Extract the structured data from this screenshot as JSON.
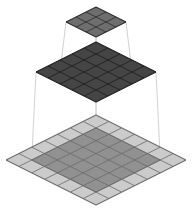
{
  "figure": {
    "type": "isometric-layer-stack-diagram",
    "background_color": "#ffffff",
    "canvas": {
      "width": 192,
      "height": 209
    }
  },
  "chart_data": {
    "type": "diagram",
    "title": "",
    "layers": [
      {
        "name": "top-layer",
        "label": "top feature map",
        "rows": 3,
        "cols": 3,
        "cells": 9,
        "fill_color": "#6e6e6e",
        "grid_line_color": "#2b2b2b",
        "center": {
          "x": 96,
          "y": 22
        },
        "half_width": 30,
        "half_height": 15,
        "shaded_region": null
      },
      {
        "name": "middle-layer",
        "label": "middle feature map",
        "rows": 5,
        "cols": 5,
        "cells": 25,
        "fill_color": "#454545",
        "grid_line_color": "#1c1c1c",
        "center": {
          "x": 96,
          "y": 72
        },
        "half_width": 60,
        "half_height": 30,
        "shaded_region": null
      },
      {
        "name": "bottom-layer",
        "label": "input plane",
        "rows": 7,
        "cols": 7,
        "cells": 49,
        "fill_color": "#cbcbcb",
        "grid_line_color": "#6a6a6a",
        "center": {
          "x": 96,
          "y": 160
        },
        "half_width": 90,
        "half_height": 45,
        "shaded_region": {
          "name": "receptive-field",
          "rows": 5,
          "cols": 5,
          "row_start": 1,
          "col_start": 1,
          "fill_color": "#919191"
        }
      }
    ],
    "connectors": {
      "name": "projection-lines",
      "color": "#d2d2d2",
      "width": 1,
      "groups": [
        {
          "from_layer": "top-layer",
          "to_layer": "middle-layer",
          "count": 4
        },
        {
          "from_layer": "middle-layer",
          "to_layer": "bottom-layer",
          "count": 4
        }
      ]
    },
    "palette": {
      "top": "#6e6e6e",
      "middle": "#454545",
      "bottom_outer": "#cbcbcb",
      "bottom_inner": "#919191",
      "lines": "#d2d2d2",
      "background": "#ffffff"
    }
  }
}
